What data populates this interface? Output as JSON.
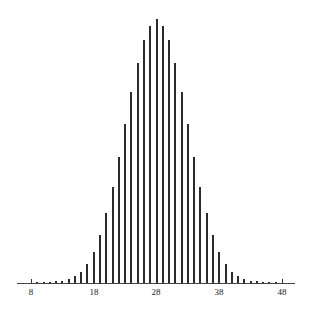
{
  "chart_data": {
    "type": "bar",
    "style": "stem",
    "title": "",
    "xlabel": "",
    "ylabel": "",
    "x": [
      8,
      9,
      10,
      11,
      12,
      13,
      14,
      15,
      16,
      17,
      18,
      19,
      20,
      21,
      22,
      23,
      24,
      25,
      26,
      27,
      28,
      29,
      30,
      31,
      32,
      33,
      34,
      35,
      36,
      37,
      38,
      39,
      40,
      41,
      42,
      43,
      44,
      45,
      46,
      47,
      48
    ],
    "values": [
      0.0,
      0.004,
      0.004,
      0.004,
      0.006,
      0.008,
      0.015,
      0.027,
      0.042,
      0.072,
      0.117,
      0.182,
      0.265,
      0.364,
      0.477,
      0.602,
      0.723,
      0.833,
      0.92,
      0.973,
      1.0,
      0.973,
      0.92,
      0.833,
      0.723,
      0.602,
      0.477,
      0.364,
      0.265,
      0.182,
      0.117,
      0.072,
      0.042,
      0.027,
      0.015,
      0.008,
      0.006,
      0.004,
      0.004,
      0.004,
      0.0
    ],
    "xticks": [
      8,
      18,
      28,
      38,
      48
    ],
    "xtick_labels": [
      "8",
      "18",
      "28",
      "38",
      "48"
    ],
    "xlim": [
      8,
      48
    ],
    "ylim": [
      0,
      1.0
    ],
    "grid": false,
    "legend": null,
    "y_axis_shown": false
  },
  "axis": {
    "tick_labels": [
      "8",
      "18",
      "28",
      "38",
      "48"
    ]
  }
}
